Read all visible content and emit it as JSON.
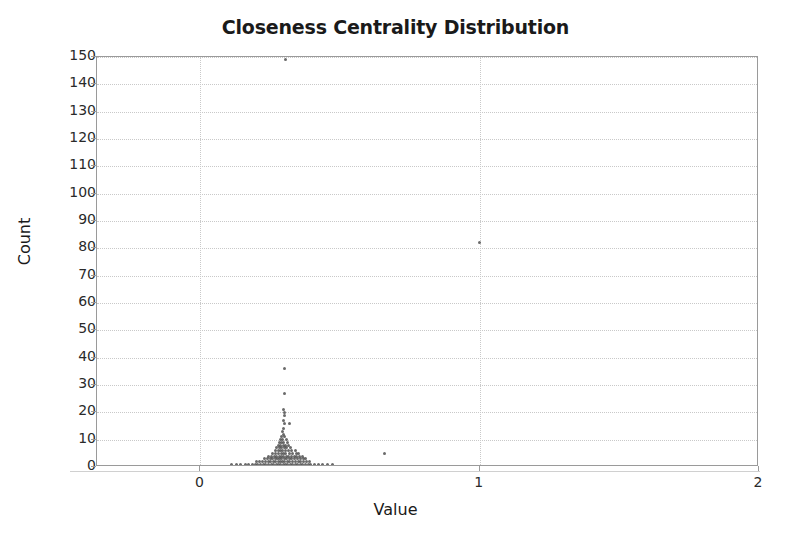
{
  "chart_data": {
    "type": "scatter",
    "title": "Closeness Centrality Distribution",
    "xlabel": "Value",
    "ylabel": "Count",
    "xlim": [
      -0.37,
      2.0
    ],
    "ylim": [
      0,
      150
    ],
    "xticks": [
      0,
      1,
      2
    ],
    "yticks": [
      0,
      10,
      20,
      30,
      40,
      50,
      60,
      70,
      80,
      90,
      100,
      110,
      120,
      130,
      140,
      150
    ],
    "grid": true,
    "legend": null,
    "point_color": "#555555",
    "marker_size_px": 3,
    "points": [
      [
        0.305,
        149
      ],
      [
        1.0,
        82
      ],
      [
        0.3,
        36
      ],
      [
        0.3,
        27
      ],
      [
        0.298,
        21
      ],
      [
        0.3,
        20
      ],
      [
        0.302,
        19
      ],
      [
        0.296,
        17
      ],
      [
        0.3,
        16
      ],
      [
        0.32,
        16
      ],
      [
        0.297,
        14
      ],
      [
        0.294,
        13
      ],
      [
        0.299,
        12
      ],
      [
        0.29,
        11
      ],
      [
        0.303,
        11
      ],
      [
        0.286,
        10
      ],
      [
        0.293,
        10
      ],
      [
        0.308,
        10
      ],
      [
        0.282,
        9
      ],
      [
        0.291,
        9
      ],
      [
        0.299,
        9
      ],
      [
        0.312,
        9
      ],
      [
        0.278,
        8
      ],
      [
        0.288,
        8
      ],
      [
        0.296,
        8
      ],
      [
        0.305,
        8
      ],
      [
        0.316,
        8
      ],
      [
        0.272,
        7
      ],
      [
        0.284,
        7
      ],
      [
        0.292,
        7
      ],
      [
        0.3,
        7
      ],
      [
        0.31,
        7
      ],
      [
        0.322,
        7
      ],
      [
        0.268,
        6
      ],
      [
        0.279,
        6
      ],
      [
        0.287,
        6
      ],
      [
        0.295,
        6
      ],
      [
        0.304,
        6
      ],
      [
        0.314,
        6
      ],
      [
        0.327,
        6
      ],
      [
        0.34,
        6
      ],
      [
        0.66,
        5
      ],
      [
        0.258,
        5
      ],
      [
        0.27,
        5
      ],
      [
        0.28,
        5
      ],
      [
        0.289,
        5
      ],
      [
        0.297,
        5
      ],
      [
        0.306,
        5
      ],
      [
        0.318,
        5
      ],
      [
        0.331,
        5
      ],
      [
        0.344,
        5
      ],
      [
        0.352,
        5
      ],
      [
        0.244,
        4
      ],
      [
        0.255,
        4
      ],
      [
        0.265,
        4
      ],
      [
        0.274,
        4
      ],
      [
        0.283,
        4
      ],
      [
        0.291,
        4
      ],
      [
        0.299,
        4
      ],
      [
        0.308,
        4
      ],
      [
        0.317,
        4
      ],
      [
        0.326,
        4
      ],
      [
        0.336,
        4
      ],
      [
        0.346,
        4
      ],
      [
        0.356,
        4
      ],
      [
        0.366,
        4
      ],
      [
        0.23,
        3
      ],
      [
        0.24,
        3
      ],
      [
        0.25,
        3
      ],
      [
        0.259,
        3
      ],
      [
        0.268,
        3
      ],
      [
        0.276,
        3
      ],
      [
        0.284,
        3
      ],
      [
        0.292,
        3
      ],
      [
        0.3,
        3
      ],
      [
        0.309,
        3
      ],
      [
        0.318,
        3
      ],
      [
        0.328,
        3
      ],
      [
        0.338,
        3
      ],
      [
        0.348,
        3
      ],
      [
        0.358,
        3
      ],
      [
        0.368,
        3
      ],
      [
        0.378,
        3
      ],
      [
        0.2,
        2
      ],
      [
        0.212,
        2
      ],
      [
        0.223,
        2
      ],
      [
        0.233,
        2
      ],
      [
        0.243,
        2
      ],
      [
        0.252,
        2
      ],
      [
        0.261,
        2
      ],
      [
        0.27,
        2
      ],
      [
        0.278,
        2
      ],
      [
        0.286,
        2
      ],
      [
        0.294,
        2
      ],
      [
        0.302,
        2
      ],
      [
        0.311,
        2
      ],
      [
        0.32,
        2
      ],
      [
        0.33,
        2
      ],
      [
        0.34,
        2
      ],
      [
        0.35,
        2
      ],
      [
        0.36,
        2
      ],
      [
        0.37,
        2
      ],
      [
        0.381,
        2
      ],
      [
        0.392,
        2
      ],
      [
        0.11,
        1
      ],
      [
        0.128,
        1
      ],
      [
        0.145,
        1
      ],
      [
        0.16,
        1
      ],
      [
        0.173,
        1
      ],
      [
        0.185,
        1
      ],
      [
        0.196,
        1
      ],
      [
        0.206,
        1
      ],
      [
        0.216,
        1
      ],
      [
        0.226,
        1
      ],
      [
        0.235,
        1
      ],
      [
        0.244,
        1
      ],
      [
        0.253,
        1
      ],
      [
        0.262,
        1
      ],
      [
        0.271,
        1
      ],
      [
        0.28,
        1
      ],
      [
        0.288,
        1
      ],
      [
        0.296,
        1
      ],
      [
        0.304,
        1
      ],
      [
        0.312,
        1
      ],
      [
        0.321,
        1
      ],
      [
        0.33,
        1
      ],
      [
        0.339,
        1
      ],
      [
        0.348,
        1
      ],
      [
        0.357,
        1
      ],
      [
        0.366,
        1
      ],
      [
        0.376,
        1
      ],
      [
        0.386,
        1
      ],
      [
        0.396,
        1
      ],
      [
        0.408,
        1
      ],
      [
        0.422,
        1
      ],
      [
        0.438,
        1
      ],
      [
        0.455,
        1
      ],
      [
        0.472,
        1
      ]
    ]
  }
}
